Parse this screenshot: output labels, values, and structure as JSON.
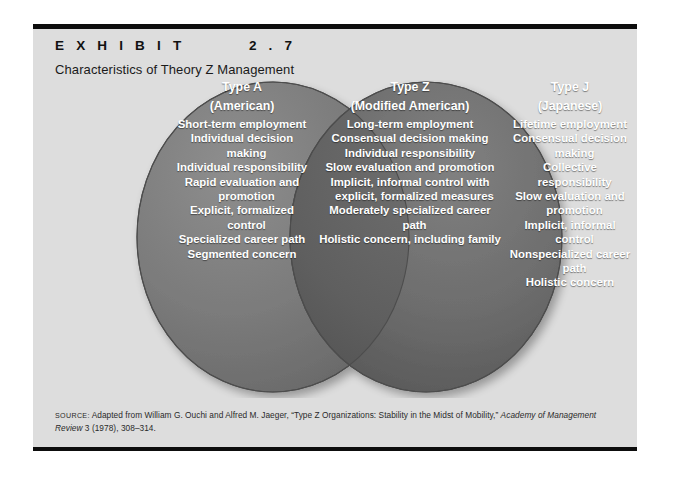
{
  "exhibit": {
    "kicker": "E X H I B I T        2 . 7",
    "title": "Characteristics of Theory Z Management"
  },
  "colors": {
    "page_background": "#dddddd",
    "rule": "#0d0d0d",
    "circle_left": "#7b7b7b",
    "circle_right": "#6a6a6a",
    "circle_overlap": "#5c5c5c",
    "circle_stroke": "#4d4d4d",
    "text_on_circle": "#ffffff"
  },
  "venn": {
    "type": "venn-2-circle",
    "columns": [
      {
        "id": "type-a",
        "heading": "Type A",
        "subheading": "(American)",
        "region": "left-only",
        "items": [
          "Short-term employment",
          "Individual decision making",
          "Individual responsibility",
          "Rapid evaluation and promotion",
          "Explicit, formalized control",
          "Specialized career path",
          "Segmented concern"
        ]
      },
      {
        "id": "type-z",
        "heading": "Type Z",
        "subheading": "(Modified American)",
        "region": "overlap",
        "items": [
          "Long-term employment",
          "Consensual decision making",
          "Individual responsibility",
          "Slow evaluation and promotion",
          "Implicit, informal control with explicit, formalized measures",
          "Moderately specialized career path",
          "Holistic concern, including family"
        ]
      },
      {
        "id": "type-j",
        "heading": "Type J",
        "subheading": "(Japanese)",
        "region": "right-only",
        "items": [
          "Lifetime employment",
          "Consensual decision making",
          "Collective responsibility",
          "Slow evaluation and promotion",
          "Implicit, informal control",
          "Nonspecialized career path",
          "Holistic concern"
        ]
      }
    ]
  },
  "source": {
    "label": "SOURCE:",
    "text_before_italic": " Adapted from William G. Ouchi and Alfred M. Jaeger, “Type Z Organizations: Stability in the Midst of Mobility,” ",
    "italic_title": "Academy of Management Review",
    "text_after_italic": " 3 (1978), 308–314."
  }
}
